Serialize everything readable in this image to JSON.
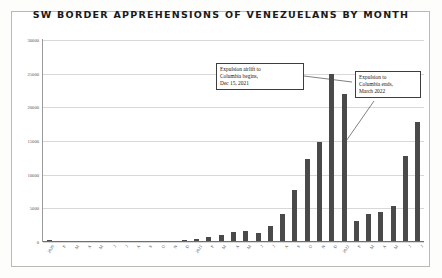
{
  "chart_data": {
    "type": "bar",
    "title": "SW BORDER APPREHENSIONS OF VENEZUELANS BY MONTH",
    "xlabel": "",
    "ylabel": "",
    "ylim": [
      0,
      30000
    ],
    "grid": true,
    "legend": "none",
    "ytick_labels": [
      "30000",
      "25000",
      "20000",
      "15000",
      "10000",
      "5000",
      "0"
    ],
    "ytick_values": [
      30000,
      25000,
      20000,
      15000,
      10000,
      5000,
      0
    ],
    "categories": [
      "2020",
      "F",
      "M",
      "A",
      "M",
      "J",
      "J",
      "A",
      "S",
      "O",
      "N",
      "D",
      "2021",
      "F",
      "M",
      "A",
      "M",
      "J",
      "J",
      "A",
      "S",
      "O",
      "N",
      "D",
      "2022",
      "F",
      "M",
      "A",
      "M",
      "J",
      "J"
    ],
    "values": [
      250,
      180,
      160,
      60,
      40,
      70,
      90,
      120,
      140,
      160,
      190,
      320,
      480,
      700,
      1100,
      1500,
      1600,
      1400,
      2400,
      4100,
      7700,
      12400,
      14800,
      24900,
      22000,
      3100,
      4200,
      4500,
      5300,
      12800,
      17800
    ],
    "bar_color": "#4a4a4a",
    "annotations": [
      {
        "id": "airlift",
        "text": "Expulsion airlift to Columbia begins, Dec 15, 2021",
        "lines": [
          "Expulsion airlift to",
          "Columbia begins,",
          "Dec 15, 2021"
        ]
      },
      {
        "id": "ends",
        "text": "Expulsion to Columbia ends, March 2022",
        "lines": [
          "Expulsion to",
          "Columbia ends,",
          "March 2022"
        ]
      }
    ]
  }
}
